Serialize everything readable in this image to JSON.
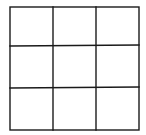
{
  "diagram": {
    "type": "grid",
    "rows": 3,
    "columns": 3,
    "cells": [
      [
        "",
        "",
        ""
      ],
      [
        "",
        "",
        ""
      ],
      [
        "",
        "",
        ""
      ]
    ],
    "stroke_color": "#1a1a1a",
    "background_color": "#ffffff",
    "bounds": {
      "x1": 10,
      "y1": 7,
      "x2": 139,
      "y2": 130
    },
    "vertical_lines_x": [
      53,
      96
    ],
    "horizontal_lines_y": [
      46,
      88
    ]
  }
}
